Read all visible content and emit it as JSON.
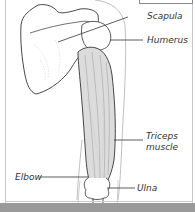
{
  "figure": {
    "labels": [
      {
        "id": "scapula",
        "text": "Scapula"
      },
      {
        "id": "humerus",
        "text": "Humerus"
      },
      {
        "id": "triceps",
        "line1": "Triceps",
        "line2": "muscle"
      },
      {
        "id": "elbow",
        "text": "Elbow"
      },
      {
        "id": "ulna",
        "text": "Ulna"
      }
    ]
  },
  "colors": {
    "ink": "#333333",
    "muscle_fill": "#dcdcdc",
    "bone_fill": "#ffffff",
    "frame": "#c8c8c8",
    "bottom_bar": "#9a9a9a"
  }
}
